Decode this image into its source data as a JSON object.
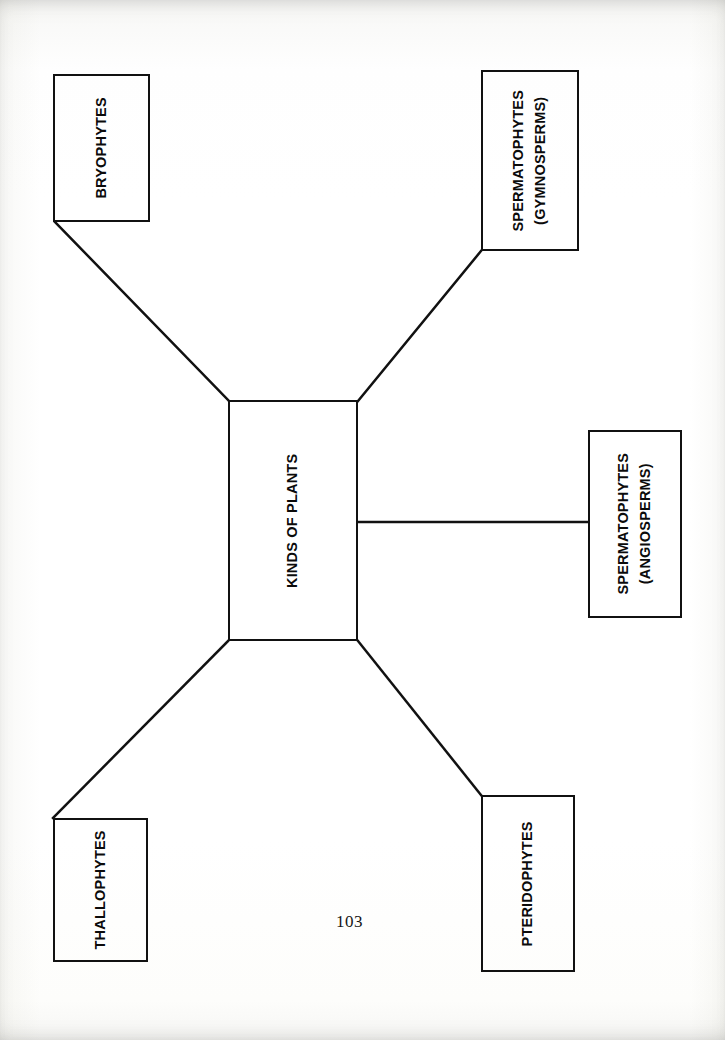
{
  "document": {
    "page_number": "103",
    "page_number_position": {
      "x": 336,
      "y": 912
    },
    "background_color": "#ffffff",
    "ink_color": "#111111"
  },
  "diagram": {
    "type": "tree-mindmap",
    "orientation": "rotated-90-counterclockwise",
    "root": {
      "id": "kinds-of-plants",
      "label": "KINDS OF PLANTS",
      "box": {
        "x": 228,
        "y": 400,
        "w": 130,
        "h": 241
      }
    },
    "nodes": [
      {
        "id": "bryophytes",
        "label": "BRYOPHYTES",
        "sublabel": "",
        "box": {
          "x": 53,
          "y": 74,
          "w": 97,
          "h": 148
        }
      },
      {
        "id": "spermatophytes-gymnosperms",
        "label": "SPERMATOPHYTES",
        "sublabel": "(GYMNOSPERMS)",
        "box": {
          "x": 481,
          "y": 70,
          "w": 98,
          "h": 181
        }
      },
      {
        "id": "spermatophytes-angiosperms",
        "label": "SPERMATOPHYTES",
        "sublabel": "(ANGIOSPERMS)",
        "box": {
          "x": 588,
          "y": 430,
          "w": 94,
          "h": 188
        }
      },
      {
        "id": "thallophytes",
        "label": "THALLOPHYTES",
        "sublabel": "",
        "box": {
          "x": 53,
          "y": 818,
          "w": 95,
          "h": 144
        }
      },
      {
        "id": "pteridophytes",
        "label": "PTERIDOPHYTES",
        "sublabel": "",
        "box": {
          "x": 481,
          "y": 795,
          "w": 94,
          "h": 177
        }
      }
    ],
    "connectors": [
      {
        "id": "root-to-bryophytes",
        "from": "kinds-of-plants",
        "to": "bryophytes",
        "x1": 228,
        "y1": 400,
        "x2": 55,
        "y2": 222
      },
      {
        "id": "root-to-gymnosperms",
        "from": "kinds-of-plants",
        "to": "spermatophytes-gymnosperms",
        "x1": 358,
        "y1": 401,
        "x2": 481,
        "y2": 251
      },
      {
        "id": "root-to-angiosperms",
        "from": "kinds-of-plants",
        "to": "spermatophytes-angiosperms",
        "x1": 358,
        "y1": 522,
        "x2": 588,
        "y2": 522
      },
      {
        "id": "root-to-thallophytes",
        "from": "kinds-of-plants",
        "to": "thallophytes",
        "x1": 228,
        "y1": 641,
        "x2": 53,
        "y2": 818
      },
      {
        "id": "root-to-pteridophytes",
        "from": "kinds-of-plants",
        "to": "pteridophytes",
        "x1": 358,
        "y1": 641,
        "x2": 481,
        "y2": 795
      }
    ]
  }
}
